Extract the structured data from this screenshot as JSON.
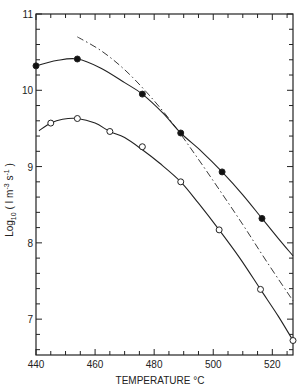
{
  "chart_data": {
    "type": "line",
    "title": "",
    "xlabel": "TEMPERATURE °C",
    "ylabel": "Log10 ( I m-3 s-1 )",
    "ylabel_parts": {
      "main": "Log",
      "sub": "10",
      "rest": " ( I m",
      "sup1": "-3",
      "mid": " s",
      "sup2": "-1",
      "end": " )"
    },
    "xlim": [
      440,
      527
    ],
    "ylim": [
      6.53,
      11
    ],
    "x_ticks": [
      440,
      460,
      480,
      500,
      520
    ],
    "y_ticks": [
      7,
      8,
      9,
      10,
      11
    ],
    "x_minor_step": 5,
    "y_minor_step": 0.2,
    "grid": false,
    "legend": null,
    "series": [
      {
        "name": "filled-circles",
        "marker": "filled-circle",
        "line": "solid",
        "points": [
          [
            440,
            10.32
          ],
          [
            454,
            10.41
          ],
          [
            476,
            9.95
          ],
          [
            489,
            9.44
          ],
          [
            503,
            8.93
          ],
          [
            516.5,
            8.32
          ]
        ],
        "curve": [
          [
            440,
            10.32
          ],
          [
            447,
            10.39
          ],
          [
            454,
            10.41
          ],
          [
            462,
            10.29
          ],
          [
            470,
            10.1
          ],
          [
            476,
            9.95
          ],
          [
            483,
            9.7
          ],
          [
            489,
            9.44
          ],
          [
            496,
            9.2
          ],
          [
            503,
            8.93
          ],
          [
            510,
            8.63
          ],
          [
            516.5,
            8.32
          ],
          [
            522,
            8.06
          ],
          [
            527,
            7.83
          ]
        ]
      },
      {
        "name": "open-circles",
        "marker": "open-circle",
        "line": "solid",
        "points": [
          [
            445,
            9.57
          ],
          [
            454,
            9.63
          ],
          [
            465,
            9.46
          ],
          [
            476,
            9.26
          ],
          [
            489,
            8.8
          ],
          [
            502,
            8.17
          ],
          [
            516,
            7.39
          ],
          [
            527,
            6.72
          ]
        ],
        "curve": [
          [
            441,
            9.47
          ],
          [
            445,
            9.57
          ],
          [
            449,
            9.62
          ],
          [
            454,
            9.63
          ],
          [
            460,
            9.57
          ],
          [
            465,
            9.46
          ],
          [
            470,
            9.38
          ],
          [
            476,
            9.22
          ],
          [
            482,
            9.04
          ],
          [
            489,
            8.8
          ],
          [
            495,
            8.52
          ],
          [
            502,
            8.17
          ],
          [
            509,
            7.8
          ],
          [
            516,
            7.39
          ],
          [
            522,
            7.04
          ],
          [
            527,
            6.72
          ]
        ]
      },
      {
        "name": "calculated",
        "marker": null,
        "line": "dash-dot",
        "points": [],
        "curve": [
          [
            454,
            10.7
          ],
          [
            462,
            10.52
          ],
          [
            470,
            10.27
          ],
          [
            478,
            9.95
          ],
          [
            486,
            9.58
          ],
          [
            494,
            9.15
          ],
          [
            502,
            8.7
          ],
          [
            510,
            8.24
          ],
          [
            518,
            7.76
          ],
          [
            527,
            7.24
          ]
        ]
      }
    ]
  }
}
